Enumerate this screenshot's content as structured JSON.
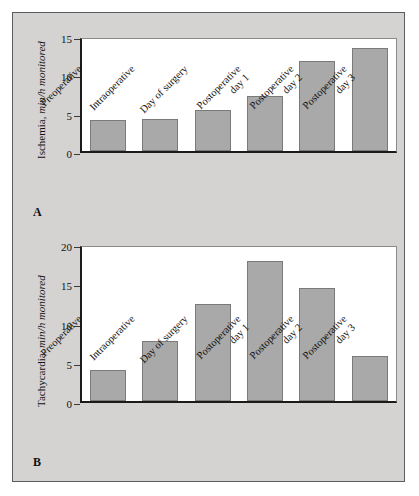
{
  "figure": {
    "background_color": "#d4d3d1",
    "border_color": "#5c5c5c",
    "bar_color": "#a9a9a9",
    "bar_border_color": "#7a7a7a",
    "axis_color": "#1a1a1a"
  },
  "panels": [
    {
      "letter": "A",
      "ylabel_plain": "Ischemia, ",
      "ylabel_italic": "min/h monitored"
    },
    {
      "letter": "B",
      "ylabel_plain": "Tachycardia, ",
      "ylabel_italic": "min/h monitored"
    }
  ],
  "categories": [
    {
      "line1": "Preoperative",
      "line2": ""
    },
    {
      "line1": "Intraoperative",
      "line2": ""
    },
    {
      "line1": "Day of surgery",
      "line2": ""
    },
    {
      "line1": "Postoperative",
      "line2": "day 1"
    },
    {
      "line1": "Postoperative",
      "line2": "day 2"
    },
    {
      "line1": "Postoperative",
      "line2": "day 3"
    }
  ],
  "chart_data": [
    {
      "type": "bar",
      "panel": "A",
      "title": "",
      "xlabel": "",
      "ylabel": "Ischemia, min/h monitored",
      "categories": [
        "Preoperative",
        "Intraoperative",
        "Day of surgery",
        "Postoperative day 1",
        "Postoperative day 2",
        "Postoperative day 3"
      ],
      "values": [
        4.0,
        4.2,
        5.4,
        7.2,
        11.7,
        13.4
      ],
      "ylim": [
        0,
        15
      ],
      "yticks": [
        0,
        5,
        10,
        15
      ],
      "ytick_labels": [
        "0",
        "5",
        "10",
        "15"
      ],
      "grid": false,
      "legend": "none"
    },
    {
      "type": "bar",
      "panel": "B",
      "title": "",
      "xlabel": "",
      "ylabel": "Tachycardia, min/h monitored",
      "categories": [
        "Preoperative",
        "Intraoperative",
        "Day of surgery",
        "Postoperative day 1",
        "Postoperative day 2",
        "Postoperative day 3"
      ],
      "values": [
        4.0,
        7.7,
        12.4,
        17.8,
        14.4,
        5.7
      ],
      "ylim": [
        0,
        20
      ],
      "yticks": [
        0,
        5,
        10,
        15,
        20
      ],
      "ytick_labels": [
        "0",
        "5",
        "10",
        "15",
        "20"
      ],
      "grid": false,
      "legend": "none"
    }
  ]
}
